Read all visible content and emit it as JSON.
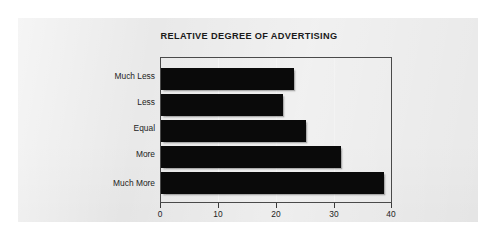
{
  "figure": {
    "background_color": "#ffffff",
    "panel_color": "#e9e9e9",
    "bar_color": "#0a0a0a",
    "frame_color": "#4a4a4a"
  },
  "chart_data": {
    "type": "bar",
    "orientation": "horizontal",
    "title": "RELATIVE DEGREE OF ADVERTISING",
    "categories": [
      "Much Less",
      "Less",
      "Equal",
      "More",
      "Much More"
    ],
    "values": [
      23,
      21,
      25,
      31,
      38.5
    ],
    "series": [
      {
        "name": "Relative degree of advertising",
        "values": [
          23,
          21,
          25,
          31,
          38.5
        ]
      }
    ],
    "xlabel": "",
    "ylabel": "",
    "xlim": [
      0,
      40
    ],
    "xticks": [
      0,
      10,
      20,
      30,
      40
    ],
    "xtick_labels": [
      "0",
      "10",
      "20",
      "30",
      "40"
    ],
    "grid": true,
    "grid_axis": "x",
    "legend": false,
    "legend_position": "none",
    "category_order": "top-to-bottom"
  }
}
